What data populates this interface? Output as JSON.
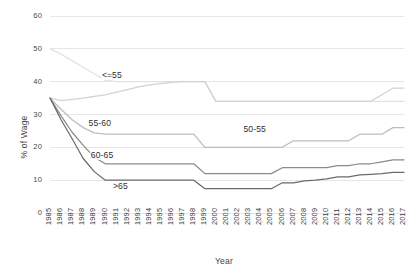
{
  "chart_data": {
    "type": "line",
    "title": "",
    "xlabel": "Year",
    "ylabel": "% of Wage",
    "xlim": [
      1985,
      2017
    ],
    "ylim": [
      0,
      60
    ],
    "ytick_labels": [
      "60",
      "50",
      "40",
      "30",
      "20",
      "10",
      "0"
    ],
    "ytick_values": [
      60,
      50,
      40,
      30,
      20,
      10,
      0
    ],
    "grid": "horizontal",
    "legend": "inline-labels",
    "x": [
      1985,
      1986,
      1987,
      1988,
      1989,
      1990,
      1991,
      1992,
      1993,
      1994,
      1995,
      1996,
      1997,
      1998,
      1999,
      2000,
      2001,
      2002,
      2003,
      2004,
      2005,
      2006,
      2007,
      2008,
      2009,
      2010,
      2011,
      2012,
      2013,
      2014,
      2015,
      2016,
      2017
    ],
    "categories": [
      "1985",
      "1986",
      "1987",
      "1988",
      "1989",
      "1990",
      "1991",
      "1992",
      "1993",
      "1994",
      "1995",
      "1996",
      "1997",
      "1998",
      "1999",
      "2000",
      "2001",
      "2002",
      "2003",
      "2004",
      "2005",
      "2006",
      "2007",
      "2008",
      "2009",
      "2010",
      "2011",
      "2012",
      "2013",
      "2014",
      "2015",
      "2016",
      "2017"
    ],
    "series": [
      {
        "name": "<=55",
        "color": "#e2e2e2",
        "label_x": 1989.6,
        "label_y": 41.6,
        "values": [
          50,
          48.4,
          46.4,
          44.4,
          42.4,
          40.4,
          40,
          40,
          40,
          40,
          40,
          40,
          40,
          40,
          40,
          34,
          34,
          34,
          34,
          34,
          34,
          34,
          34,
          34,
          34,
          34,
          34,
          34,
          34,
          34,
          34,
          34,
          34
        ]
      },
      {
        "name": "50-55",
        "color": "#d2d2d2",
        "label_x": 2002.4,
        "label_y": 25.4,
        "values": [
          35,
          34.2,
          34.6,
          35,
          35.5,
          36,
          36.8,
          37.6,
          38.4,
          39,
          39.4,
          39.8,
          40,
          40,
          40,
          34,
          34,
          34,
          34,
          34,
          34,
          34,
          34,
          34,
          34,
          34,
          34,
          34,
          34,
          34,
          36,
          38,
          38
        ]
      },
      {
        "name": "55-60",
        "color": "#bdbdbd",
        "label_x": 1988.4,
        "label_y": 27.2,
        "values": [
          35,
          31.6,
          28.4,
          26,
          24.4,
          24,
          24,
          24,
          24,
          24,
          24,
          24,
          24,
          24,
          20,
          20,
          20,
          20,
          20,
          20,
          20,
          20,
          22,
          22,
          22,
          22,
          22,
          22,
          24,
          24,
          24,
          26,
          26
        ]
      },
      {
        "name": "60-65",
        "color": "#8a8a8a",
        "label_x": 1988.6,
        "label_y": 17.4,
        "values": [
          35,
          29.6,
          24.6,
          20.6,
          17,
          15,
          15,
          15,
          15,
          15,
          15,
          15,
          15,
          15,
          12,
          12,
          12,
          12,
          12,
          12,
          12,
          13.8,
          13.8,
          13.8,
          13.8,
          13.8,
          14.4,
          14.4,
          15,
          15,
          15.6,
          16.2,
          16.2
        ]
      },
      {
        "name": ">65",
        "color": "#6b6b6b",
        "label_x": 1990.6,
        "label_y": 8.0,
        "values": [
          35,
          28.4,
          22.6,
          16.6,
          12.6,
          10,
          10,
          10,
          10,
          10,
          10,
          10,
          10,
          10,
          7.4,
          7.4,
          7.4,
          7.4,
          7.4,
          7.4,
          7.4,
          9.2,
          9.2,
          9.8,
          10,
          10.4,
          11,
          11,
          11.6,
          11.8,
          12,
          12.4,
          12.4
        ]
      }
    ]
  },
  "plot": {
    "left": 50,
    "right": 404,
    "top": 16,
    "bottom": 213
  }
}
